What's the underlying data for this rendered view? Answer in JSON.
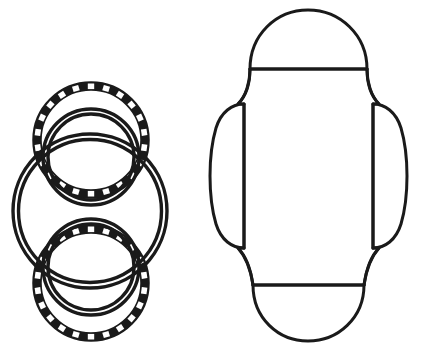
{
  "canvas": {
    "width": 425,
    "height": 352,
    "background_color": "#ffffff",
    "ink_color": "#1a1a1a",
    "style": "black-and-white line art"
  },
  "figures": [
    {
      "id": "left-figure",
      "name": "beaded-rings-figure",
      "description": "Large double-outlined circle overlapped top and bottom by two beaded (chain-link) rings",
      "bounds": {
        "x": 12,
        "y": 82,
        "width": 157,
        "height": 258
      },
      "parts": [
        {
          "name": "large-double-circle",
          "type": "concentric-circles",
          "cx": 90,
          "cy": 211,
          "outer_r": 78,
          "inner_r": 72,
          "stroke_width": 3.4
        },
        {
          "name": "top-beaded-ring",
          "type": "beaded-ring",
          "cx": 91,
          "cy": 140,
          "outer_r": 58,
          "band_inner_r": 50,
          "bead_count": 22,
          "stroke_width": 3.4
        },
        {
          "name": "top-inner-circle",
          "type": "double-circle",
          "cx": 91,
          "cy": 156,
          "outer_r": 48,
          "inner_r": 43,
          "stroke_width": 3.4
        },
        {
          "name": "bottom-beaded-ring",
          "type": "beaded-ring",
          "cx": 91,
          "cy": 283,
          "outer_r": 58,
          "band_inner_r": 50,
          "bead_count": 22,
          "stroke_width": 3.4
        },
        {
          "name": "bottom-inner-circle",
          "type": "double-circle",
          "cx": 91,
          "cy": 268,
          "outer_r": 48,
          "inner_r": 43,
          "stroke_width": 3.4
        }
      ]
    },
    {
      "id": "right-figure",
      "name": "carton-blank-figure",
      "description": "Unfolded carton blank outline with a semicircular dome flap on top, rounded flap on bottom, curved side flaps left and right, and a central panel",
      "bounds": {
        "x": 210,
        "y": 9,
        "width": 196,
        "height": 333
      },
      "parts": [
        {
          "name": "top-dome-flap",
          "type": "semicircle-dome",
          "cx": 308,
          "cy": 68,
          "rx": 58,
          "ry": 58,
          "baseline_y": 68,
          "stroke_width": 3.0
        },
        {
          "name": "top-fold-line",
          "type": "horizontal-line",
          "x1": 250,
          "x2": 367,
          "y": 68,
          "stroke_width": 3.0
        },
        {
          "name": "central-panel",
          "type": "rounded-octagon",
          "stroke_width": 3.0
        },
        {
          "name": "left-side-flap",
          "type": "curved-bulge",
          "fold_line_x": 244,
          "top_y": 104,
          "bottom_y": 246,
          "extent_x": 210,
          "stroke_width": 3.0
        },
        {
          "name": "left-fold-line",
          "type": "vertical-line",
          "x": 244,
          "y1": 104,
          "y2": 247,
          "stroke_width": 3.0
        },
        {
          "name": "right-side-flap",
          "type": "curved-bulge",
          "fold_line_x": 373,
          "top_y": 104,
          "bottom_y": 246,
          "extent_x": 406,
          "stroke_width": 3.0
        },
        {
          "name": "right-fold-line",
          "type": "vertical-line",
          "x": 373,
          "y1": 104,
          "y2": 247,
          "stroke_width": 3.0
        },
        {
          "name": "bottom-fold-line",
          "type": "horizontal-line",
          "x1": 253,
          "x2": 364,
          "y": 285,
          "stroke_width": 3.0
        },
        {
          "name": "bottom-round-flap",
          "type": "semicircle-dome-inverted",
          "cx": 308,
          "cy": 285,
          "rx": 55,
          "ry": 56,
          "stroke_width": 3.0
        }
      ]
    }
  ],
  "labels": {
    "visible_text": []
  }
}
